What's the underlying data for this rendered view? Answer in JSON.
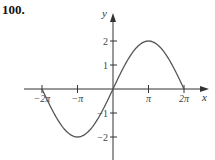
{
  "problem_number": "100.",
  "chart_data": {
    "type": "line",
    "title": "",
    "xlabel": "x",
    "ylabel": "y",
    "function": "y = 2 sin(x/2)",
    "xlim": [
      -6.2832,
      6.2832
    ],
    "ylim": [
      -2.5,
      2.5
    ],
    "x_ticks": [
      {
        "value": -6.2832,
        "label": "−2π"
      },
      {
        "value": -3.1416,
        "label": "−π"
      },
      {
        "value": 3.1416,
        "label": "π"
      },
      {
        "value": 6.2832,
        "label": "2π"
      }
    ],
    "y_ticks": [
      {
        "value": 2,
        "label": "2"
      },
      {
        "value": 1,
        "label": "1"
      },
      {
        "value": -1,
        "label": "−1"
      },
      {
        "value": -2,
        "label": "−2"
      }
    ],
    "series": [
      {
        "name": "curve",
        "x": [
          -6.2832,
          -4.7124,
          -3.1416,
          -1.5708,
          0,
          1.5708,
          3.1416,
          4.7124,
          6.2832
        ],
        "y": [
          0,
          -1.414,
          -2,
          -1.414,
          0,
          1.414,
          2,
          1.414,
          0
        ]
      }
    ],
    "grid": false,
    "legend": null
  },
  "colors": {
    "axis": "#333333",
    "curve": "#555555",
    "text": "#444444"
  }
}
